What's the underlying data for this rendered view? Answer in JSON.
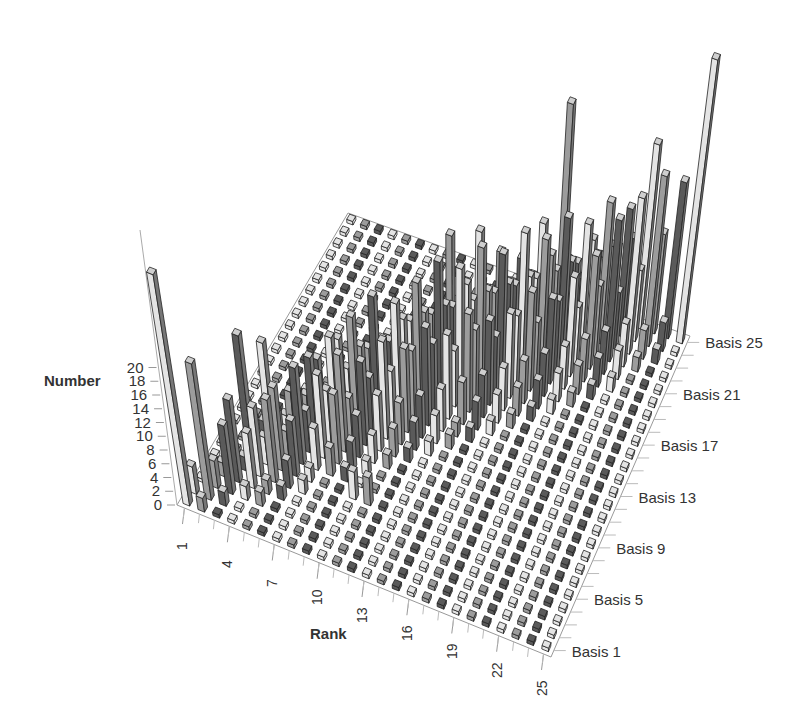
{
  "chart_data": {
    "type": "bar3d",
    "title": "",
    "xlabel": "Rank",
    "ylabel": "Basis",
    "zlabel": "Number",
    "zlim": [
      0,
      20
    ],
    "z_ticks": [
      "0",
      "2",
      "4",
      "6",
      "8",
      "10",
      "12",
      "14",
      "16",
      "18",
      "20"
    ],
    "x_ticks": [
      "1",
      "4",
      "7",
      "10",
      "13",
      "16",
      "19",
      "22",
      "25"
    ],
    "y_ticks": [
      "Basis 1",
      "Basis 5",
      "Basis 9",
      "Basis 13",
      "Basis 17",
      "Basis 21",
      "Basis 25"
    ],
    "grid": false,
    "ranks": 25,
    "bases": 25,
    "note": "values[basis-1][rank-1]; approximate heights read from 3D bar histogram",
    "values": [
      [
        17,
        1,
        0,
        0,
        0,
        0,
        0,
        0,
        0,
        0,
        0,
        0,
        0,
        0,
        0,
        0,
        0,
        0,
        0,
        0,
        0,
        0,
        0,
        0,
        0
      ],
      [
        2,
        10,
        1,
        0,
        0,
        0,
        0,
        0,
        0,
        0,
        0,
        0,
        0,
        0,
        0,
        0,
        0,
        0,
        0,
        0,
        0,
        0,
        0,
        0,
        0
      ],
      [
        0,
        2,
        5,
        1,
        1,
        0,
        0,
        0,
        0,
        0,
        0,
        0,
        0,
        0,
        0,
        0,
        0,
        0,
        0,
        0,
        0,
        0,
        0,
        0,
        0
      ],
      [
        0,
        1,
        6,
        4,
        1,
        1,
        0,
        0,
        0,
        0,
        0,
        0,
        0,
        0,
        0,
        0,
        0,
        0,
        0,
        0,
        0,
        0,
        0,
        0,
        0
      ],
      [
        0,
        0,
        1,
        5,
        6,
        2,
        1,
        0,
        0,
        0,
        0,
        0,
        0,
        0,
        0,
        0,
        0,
        0,
        0,
        0,
        0,
        0,
        0,
        0,
        0
      ],
      [
        0,
        0,
        9,
        2,
        6,
        4,
        1,
        0,
        0,
        2,
        2,
        0,
        0,
        0,
        0,
        0,
        0,
        0,
        0,
        0,
        0,
        0,
        0,
        0,
        0
      ],
      [
        0,
        0,
        0,
        8,
        2,
        7,
        3,
        2,
        1,
        0,
        0,
        0,
        0,
        0,
        0,
        0,
        0,
        0,
        0,
        0,
        0,
        0,
        0,
        0,
        0
      ],
      [
        0,
        0,
        1,
        2,
        4,
        3,
        6,
        5,
        2,
        1,
        0,
        0,
        0,
        0,
        0,
        0,
        0,
        0,
        0,
        0,
        0,
        0,
        0,
        0,
        0
      ],
      [
        0,
        0,
        0,
        1,
        3,
        6,
        4,
        7,
        3,
        2,
        1,
        0,
        0,
        0,
        0,
        0,
        0,
        0,
        0,
        0,
        0,
        0,
        0,
        0,
        0
      ],
      [
        0,
        0,
        0,
        0,
        2,
        5,
        7,
        3,
        6,
        4,
        2,
        1,
        0,
        0,
        0,
        0,
        0,
        0,
        0,
        0,
        0,
        0,
        0,
        0,
        0
      ],
      [
        0,
        0,
        0,
        0,
        1,
        2,
        6,
        8,
        4,
        7,
        3,
        2,
        1,
        0,
        0,
        0,
        0,
        0,
        0,
        0,
        0,
        0,
        0,
        0,
        0
      ],
      [
        0,
        0,
        0,
        0,
        0,
        1,
        3,
        5,
        9,
        4,
        6,
        3,
        2,
        1,
        0,
        0,
        0,
        0,
        0,
        0,
        0,
        0,
        0,
        0,
        0
      ],
      [
        0,
        0,
        0,
        0,
        0,
        0,
        2,
        4,
        5,
        8,
        5,
        7,
        3,
        1,
        1,
        0,
        0,
        0,
        0,
        0,
        0,
        0,
        0,
        0,
        0
      ],
      [
        0,
        0,
        0,
        0,
        0,
        0,
        1,
        2,
        4,
        6,
        9,
        5,
        6,
        3,
        2,
        1,
        0,
        0,
        0,
        0,
        0,
        0,
        0,
        0,
        0
      ],
      [
        0,
        0,
        0,
        0,
        0,
        0,
        0,
        1,
        3,
        5,
        6,
        10,
        4,
        7,
        3,
        2,
        1,
        0,
        0,
        0,
        0,
        0,
        0,
        0,
        0
      ],
      [
        0,
        0,
        0,
        0,
        0,
        0,
        0,
        0,
        1,
        4,
        5,
        6,
        9,
        5,
        6,
        3,
        2,
        1,
        0,
        0,
        0,
        0,
        0,
        0,
        0
      ],
      [
        0,
        0,
        0,
        0,
        0,
        0,
        0,
        0,
        1,
        2,
        4,
        5,
        7,
        10,
        4,
        6,
        3,
        2,
        1,
        0,
        0,
        0,
        0,
        0,
        0
      ],
      [
        0,
        0,
        0,
        0,
        0,
        0,
        0,
        0,
        0,
        1,
        3,
        4,
        5,
        6,
        9,
        5,
        7,
        3,
        2,
        1,
        0,
        0,
        0,
        0,
        0
      ],
      [
        0,
        0,
        0,
        0,
        0,
        0,
        0,
        0,
        0,
        1,
        8,
        3,
        9,
        5,
        6,
        10,
        4,
        6,
        3,
        2,
        1,
        0,
        0,
        0,
        0
      ],
      [
        0,
        0,
        0,
        0,
        0,
        0,
        0,
        0,
        0,
        0,
        1,
        2,
        4,
        7,
        5,
        6,
        9,
        5,
        7,
        3,
        2,
        1,
        0,
        0,
        0
      ],
      [
        0,
        0,
        0,
        0,
        0,
        0,
        0,
        0,
        0,
        0,
        0,
        1,
        3,
        4,
        6,
        5,
        7,
        10,
        4,
        8,
        3,
        2,
        0,
        0,
        0
      ],
      [
        0,
        0,
        0,
        0,
        0,
        0,
        0,
        0,
        0,
        0,
        0,
        0,
        1,
        3,
        4,
        8,
        5,
        6,
        9,
        5,
        10,
        3,
        1,
        0,
        0
      ],
      [
        0,
        0,
        0,
        0,
        0,
        0,
        0,
        0,
        0,
        0,
        0,
        0,
        0,
        1,
        3,
        4,
        16,
        5,
        7,
        10,
        4,
        11,
        2,
        1,
        0
      ],
      [
        0,
        0,
        0,
        0,
        0,
        0,
        0,
        0,
        0,
        0,
        0,
        0,
        0,
        0,
        1,
        2,
        4,
        3,
        5,
        6,
        9,
        5,
        12,
        2,
        0
      ],
      [
        0,
        0,
        0,
        0,
        0,
        0,
        0,
        0,
        0,
        0,
        0,
        0,
        0,
        0,
        0,
        1,
        2,
        3,
        4,
        5,
        6,
        13,
        7,
        11,
        20
      ]
    ],
    "shades": [
      "#e4e4e4",
      "#9c9c9c",
      "#5a5a5a"
    ],
    "edge_color": "#222222"
  }
}
